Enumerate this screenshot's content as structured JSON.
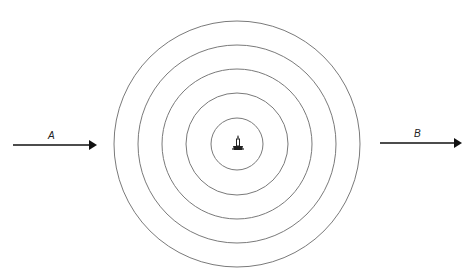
{
  "diagram": {
    "type": "concentric-wavefronts",
    "center": {
      "x": 237,
      "y": 144
    },
    "circle_radii": [
      26,
      51,
      75,
      99,
      123
    ],
    "source_icon": "candle-icon",
    "arrows": [
      {
        "label": "A",
        "x1": 13,
        "y1": 145,
        "x2": 95,
        "y2": 145
      },
      {
        "label": "B",
        "x1": 380,
        "y1": 143,
        "x2": 462,
        "y2": 143
      }
    ],
    "stroke_color": "#777777",
    "arrow_color": "#111111"
  },
  "labels": {
    "arrow_a": "A",
    "arrow_b": "B"
  }
}
